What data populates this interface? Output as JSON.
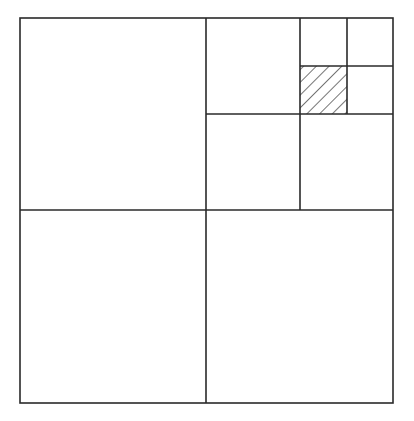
{
  "diagram": {
    "type": "quadtree-subdivision",
    "canvas": {
      "width": 414,
      "height": 421,
      "background": "#ffffff"
    },
    "stroke_color": "#2a2a2a",
    "stroke_width": 1.6,
    "hatch_color": "#2a2a2a",
    "outer_square": {
      "x": 20,
      "y": 18,
      "w": 373,
      "h": 385
    },
    "level1_split": {
      "x": 206,
      "y": 210
    },
    "level2_split": {
      "x": 300,
      "y": 114
    },
    "level3_split": {
      "x": 347,
      "y": 66
    },
    "highlighted_cell": {
      "x": 300,
      "y": 66,
      "w": 47,
      "h": 48,
      "fill": "diagonal-hatch",
      "level": 3,
      "path": [
        "top-right",
        "top-right",
        "bottom-left"
      ]
    },
    "cells": [
      {
        "id": "L1-top-left",
        "level": 1
      },
      {
        "id": "L1-bottom-left",
        "level": 1
      },
      {
        "id": "L1-bottom-right",
        "level": 1
      },
      {
        "id": "L2-top-left",
        "level": 2
      },
      {
        "id": "L2-bottom-left",
        "level": 2
      },
      {
        "id": "L2-bottom-right",
        "level": 2
      },
      {
        "id": "L3-top-left",
        "level": 3
      },
      {
        "id": "L3-top-right",
        "level": 3
      },
      {
        "id": "L3-bottom-left",
        "level": 3,
        "hatched": true
      },
      {
        "id": "L3-bottom-right",
        "level": 3
      }
    ]
  }
}
